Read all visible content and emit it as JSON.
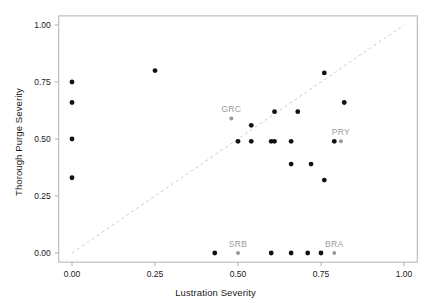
{
  "chart_data": {
    "type": "scatter",
    "title": "",
    "xlabel": "Lustration Severity",
    "ylabel": "Thorough Purge Severity",
    "xlim": [
      -0.04,
      1.04
    ],
    "ylim": [
      -0.04,
      1.04
    ],
    "xticks": [
      0.0,
      0.25,
      0.5,
      0.75,
      1.0
    ],
    "xticklabels": [
      "0.00",
      "0.25",
      "0.50",
      "0.75",
      "1.00"
    ],
    "yticks": [
      0.0,
      0.25,
      0.5,
      0.75,
      1.0
    ],
    "yticklabels": [
      "0.00",
      "0.25",
      "0.50",
      "0.75",
      "1.00"
    ],
    "grid": false,
    "legend": null,
    "point_color": "#111111",
    "highlight_color": "#999999",
    "reference_line": {
      "type": "dashed-diagonal",
      "from": [
        0.0,
        0.0
      ],
      "to": [
        1.0,
        1.0
      ],
      "color": "#cccccc",
      "dash": "3,3"
    },
    "points": [
      {
        "x": 0.0,
        "y": 0.75,
        "label": "",
        "highlight": false
      },
      {
        "x": 0.0,
        "y": 0.66,
        "label": "",
        "highlight": false
      },
      {
        "x": 0.0,
        "y": 0.5,
        "label": "",
        "highlight": false
      },
      {
        "x": 0.0,
        "y": 0.33,
        "label": "",
        "highlight": false
      },
      {
        "x": 0.25,
        "y": 0.8,
        "label": "",
        "highlight": false
      },
      {
        "x": 0.48,
        "y": 0.59,
        "label": "GRC",
        "highlight": true
      },
      {
        "x": 0.5,
        "y": 0.49,
        "label": "",
        "highlight": false
      },
      {
        "x": 0.54,
        "y": 0.56,
        "label": "",
        "highlight": false
      },
      {
        "x": 0.54,
        "y": 0.49,
        "label": "",
        "highlight": false
      },
      {
        "x": 0.6,
        "y": 0.49,
        "label": "",
        "highlight": false
      },
      {
        "x": 0.61,
        "y": 0.49,
        "label": "",
        "highlight": false
      },
      {
        "x": 0.61,
        "y": 0.62,
        "label": "",
        "highlight": false
      },
      {
        "x": 0.66,
        "y": 0.49,
        "label": "",
        "highlight": false
      },
      {
        "x": 0.66,
        "y": 0.39,
        "label": "",
        "highlight": false
      },
      {
        "x": 0.68,
        "y": 0.62,
        "label": "",
        "highlight": false
      },
      {
        "x": 0.72,
        "y": 0.39,
        "label": "",
        "highlight": false
      },
      {
        "x": 0.76,
        "y": 0.79,
        "label": "",
        "highlight": false
      },
      {
        "x": 0.76,
        "y": 0.32,
        "label": "",
        "highlight": false
      },
      {
        "x": 0.79,
        "y": 0.49,
        "label": "",
        "highlight": false
      },
      {
        "x": 0.81,
        "y": 0.49,
        "label": "PRY",
        "highlight": true
      },
      {
        "x": 0.82,
        "y": 0.66,
        "label": "",
        "highlight": false
      },
      {
        "x": 0.43,
        "y": 0.0,
        "label": "",
        "highlight": false
      },
      {
        "x": 0.5,
        "y": 0.0,
        "label": "SRB",
        "highlight": true
      },
      {
        "x": 0.6,
        "y": 0.0,
        "label": "",
        "highlight": false
      },
      {
        "x": 0.66,
        "y": 0.0,
        "label": "",
        "highlight": false
      },
      {
        "x": 0.71,
        "y": 0.0,
        "label": "",
        "highlight": false
      },
      {
        "x": 0.75,
        "y": 0.0,
        "label": "",
        "highlight": false
      },
      {
        "x": 0.79,
        "y": 0.0,
        "label": "BRA",
        "highlight": true
      }
    ]
  }
}
